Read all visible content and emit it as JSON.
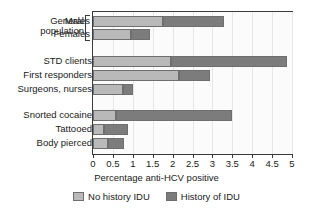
{
  "chart_data": {
    "type": "bar",
    "orientation": "horizontal",
    "stacked": true,
    "title": "",
    "xlabel": "Percentage anti-HCV positive",
    "ylabel": "",
    "xlim": [
      0,
      5
    ],
    "xticks": [
      "0",
      "0.5",
      "1",
      "1.5",
      "2",
      "2.5",
      "3",
      "3.5",
      "4",
      "4.5",
      "5"
    ],
    "xtick_values": [
      0,
      0.5,
      1,
      1.5,
      2,
      2.5,
      3,
      3.5,
      4,
      4.5,
      5
    ],
    "grid": true,
    "legend_position": "bottom",
    "group_label": "General population",
    "categories": [
      "Males",
      "Females",
      "STD clients",
      "First responders",
      "Surgeons, nurses",
      "Snorted cocaine",
      "Tattooed",
      "Body pierced"
    ],
    "series": [
      {
        "name": "No history IDU",
        "color": "#b9b9b9",
        "values": [
          1.75,
          0.95,
          1.97,
          2.17,
          0.75,
          0.57,
          0.28,
          0.38
        ]
      },
      {
        "name": "History of IDU",
        "color": "#7c7c7c",
        "values": [
          1.55,
          0.47,
          2.91,
          0.78,
          0.25,
          2.93,
          0.59,
          0.4
        ]
      }
    ],
    "totals": [
      3.3,
      1.42,
      4.88,
      2.95,
      1.0,
      3.5,
      0.87,
      0.78
    ]
  },
  "legend": {
    "items": [
      {
        "label": "No history IDU",
        "color": "#b9b9b9"
      },
      {
        "label": "History of IDU",
        "color": "#7c7c7c"
      }
    ]
  }
}
